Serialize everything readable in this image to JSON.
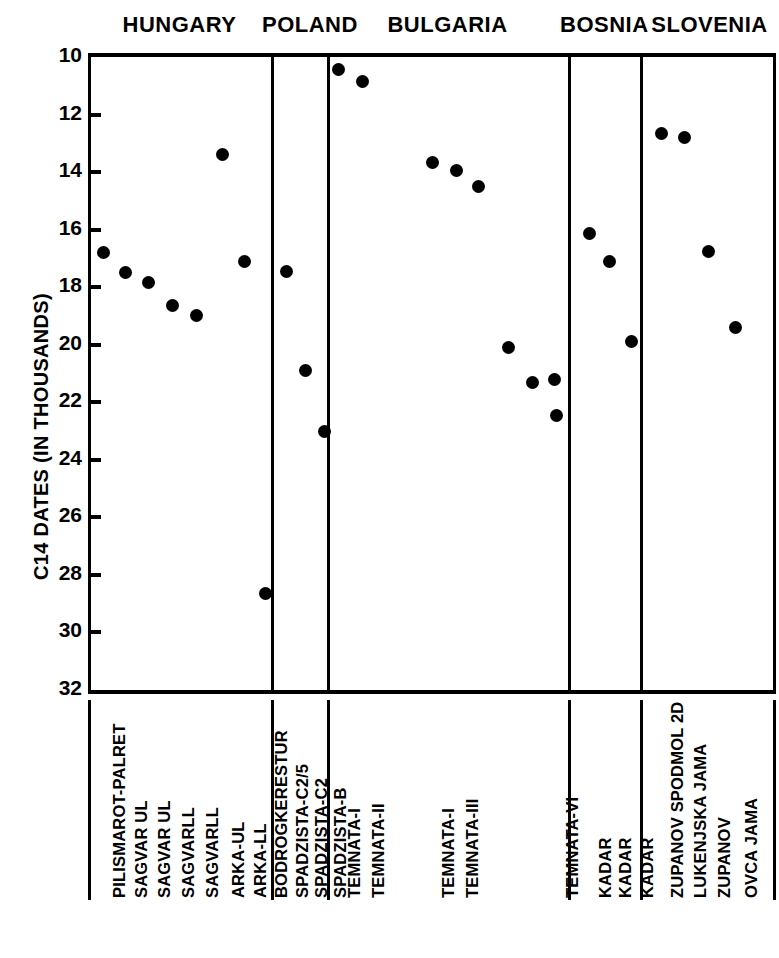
{
  "chart_data": {
    "type": "scatter",
    "title": "",
    "xlabel": "",
    "ylabel": "C14 DATES (IN THOUSANDS)",
    "ylim": [
      10,
      32
    ],
    "y_inverted": true,
    "ytick_labels": [
      "10",
      "12",
      "14",
      "16",
      "18",
      "20",
      "22",
      "24",
      "26",
      "28",
      "30",
      "32"
    ],
    "ytick_values": [
      10,
      12,
      14,
      16,
      18,
      20,
      22,
      24,
      26,
      28,
      30,
      32
    ],
    "grid": false,
    "legend": "none",
    "error_bars": "vertical",
    "regions": [
      {
        "name": "HUNGARY",
        "points": [
          {
            "label": "PILISMAROT-PALRET",
            "value": 16.8,
            "low": 16.2,
            "high": 17.4
          },
          {
            "label": "SAGVAR UL",
            "value": 17.5,
            "low": 17.5,
            "high": 17.5
          },
          {
            "label": "SAGVAR UL",
            "value": 17.85,
            "low": 17.85,
            "high": 17.85
          },
          {
            "label": "SAGVARLL",
            "value": 18.65,
            "low": 18.45,
            "high": 18.85
          },
          {
            "label": "SAGVARLL",
            "value": 19.0,
            "low": 19.0,
            "high": 19.0
          },
          {
            "label": "ARKA-UL",
            "value": 13.4,
            "low": 13.0,
            "high": 13.8
          },
          {
            "label": "ARKA-LL",
            "value": 17.1,
            "low": 16.8,
            "high": 17.4
          },
          {
            "label": "BODROGKERESTUR",
            "value": 28.65,
            "low": 25.9,
            "high": 31.7
          }
        ]
      },
      {
        "name": "POLAND",
        "points": [
          {
            "label": "SPADZISTA-C2/5",
            "value": 17.45,
            "low": 17.1,
            "high": 17.8
          },
          {
            "label": "SPADZISTA-C2",
            "value": 20.9,
            "low": 20.4,
            "high": 21.4
          },
          {
            "label": "SPADZISTA-B",
            "value": 23.0,
            "low": 22.7,
            "high": 23.3
          }
        ]
      },
      {
        "name": "BULGARIA",
        "points": [
          {
            "label": "TEMNATA-I",
            "value": 10.45,
            "low": 10.1,
            "high": 10.8
          },
          {
            "label": "TEMNATA-II",
            "value": 10.85,
            "low": 10.2,
            "high": 11.5
          },
          {
            "label": "TEMNATA-I",
            "value": 13.65,
            "low": 13.4,
            "high": 13.9
          },
          {
            "label": "TEMNATA-III",
            "value": 13.95,
            "low": 13.3,
            "high": 14.6
          },
          {
            "label": "",
            "value": 14.5,
            "low": 14.2,
            "high": 14.8
          },
          {
            "label": "",
            "value": 20.1,
            "low": 19.2,
            "high": 21.0
          },
          {
            "label": "",
            "value": 21.3,
            "low": 20.9,
            "high": 21.7
          },
          {
            "label": "",
            "value": 21.2,
            "low": 20.8,
            "high": 21.6
          },
          {
            "label": "TEMNATA-VI",
            "value": 22.45,
            "low": 21.8,
            "high": 23.1
          }
        ]
      },
      {
        "name": "BOSNIA",
        "points": [
          {
            "label": "KADAR",
            "value": 16.15,
            "low": 14.1,
            "high": 18.2
          },
          {
            "label": "KADAR",
            "value": 17.1,
            "low": 15.5,
            "high": 18.7
          },
          {
            "label": "KADAR",
            "value": 19.9,
            "low": 18.0,
            "high": 21.9
          }
        ]
      },
      {
        "name": "SLOVENIA",
        "points": [
          {
            "label": "ZUPANOV SPODMOL 2D",
            "value": 12.65,
            "low": 12.4,
            "high": 12.9
          },
          {
            "label": "LUKENJSKA JAMA",
            "value": 12.8,
            "low": 12.5,
            "high": 13.1
          },
          {
            "label": "ZUPANOV",
            "value": 16.75,
            "low": 16.6,
            "high": 16.9
          },
          {
            "label": "OVCA JAMA",
            "value": 19.4,
            "low": 19.0,
            "high": 19.8
          }
        ]
      }
    ]
  }
}
